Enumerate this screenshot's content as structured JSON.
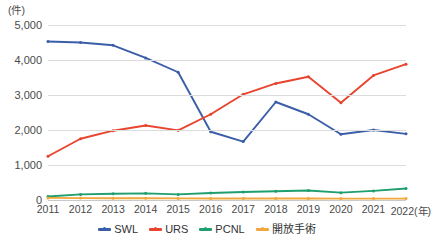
{
  "chart_data": {
    "type": "line",
    "title": "",
    "xlabel": "(年)",
    "ylabel": "(件)",
    "unit_label": "(件)",
    "x_unit_suffix": "(年)",
    "categories": [
      "2011",
      "2012",
      "2013",
      "2014",
      "2015",
      "2016",
      "2017",
      "2018",
      "2019",
      "2020",
      "2021",
      "2022"
    ],
    "ylim": [
      0,
      5000
    ],
    "y_ticks": [
      "0",
      "1,000",
      "2,000",
      "3,000",
      "4,000",
      "5,000"
    ],
    "y_tick_values": [
      0,
      1000,
      2000,
      3000,
      4000,
      5000
    ],
    "grid": true,
    "legend_position": "bottom",
    "series": [
      {
        "name": "SWL",
        "color": "#3b5ea8",
        "values": [
          4530,
          4500,
          4420,
          4060,
          3650,
          1950,
          1670,
          2800,
          2450,
          1880,
          2000,
          1890
        ]
      },
      {
        "name": "URS",
        "color": "#e8442e",
        "values": [
          1250,
          1750,
          1980,
          2130,
          1990,
          2450,
          3020,
          3330,
          3520,
          2780,
          3560,
          3880
        ]
      },
      {
        "name": "PCNL",
        "color": "#1f9e6e",
        "values": [
          100,
          160,
          180,
          190,
          160,
          200,
          230,
          250,
          270,
          210,
          260,
          330
        ]
      },
      {
        "name": "開放手術",
        "color": "#f0a73c",
        "values": [
          60,
          55,
          50,
          50,
          45,
          45,
          45,
          45,
          45,
          40,
          40,
          40
        ]
      }
    ]
  },
  "legend": {
    "items": [
      {
        "label": "SWL",
        "color": "#3b5ea8"
      },
      {
        "label": "URS",
        "color": "#e8442e"
      },
      {
        "label": "PCNL",
        "color": "#1f9e6e"
      },
      {
        "label": "開放手術",
        "color": "#f0a73c"
      }
    ]
  }
}
